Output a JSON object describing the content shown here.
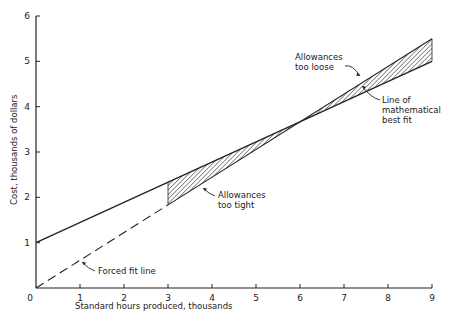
{
  "chart_data": {
    "type": "line",
    "title": "",
    "xlabel": "Standard hours produced, thousands",
    "ylabel": "Cost, thousands of dollars",
    "xlim": [
      0,
      9
    ],
    "ylim": [
      0,
      6
    ],
    "x_ticks": [
      "0",
      "1",
      "2",
      "3",
      "4",
      "5",
      "6",
      "7",
      "8",
      "9"
    ],
    "y_ticks": [
      "1",
      "2",
      "3",
      "4",
      "5",
      "6"
    ],
    "grid": false,
    "series": [
      {
        "name": "Line of mathematical best fit",
        "style": "solid",
        "points": [
          [
            0,
            1.0
          ],
          [
            9,
            5.0
          ]
        ]
      },
      {
        "name": "Forced fit line",
        "style": "dashed from 0 to 3, solid from 3 to 9",
        "points": [
          [
            0,
            0.0
          ],
          [
            9,
            5.5
          ]
        ]
      }
    ],
    "shaded_regions": [
      {
        "name": "Allowances too tight",
        "x_range": [
          3,
          6
        ],
        "between": [
          "Line of mathematical best fit",
          "Forced fit line"
        ],
        "pattern": "hatched"
      },
      {
        "name": "Allowances too loose",
        "x_range": [
          6,
          9
        ],
        "between": [
          "Forced fit line",
          "Line of mathematical best fit"
        ],
        "pattern": "hatched"
      }
    ],
    "annotations": [
      {
        "text_lines": [
          "Allowances",
          "too loose"
        ],
        "points_to": [
          7.4,
          4.5
        ]
      },
      {
        "text_lines": [
          "Line of",
          "mathematical",
          "best fit"
        ],
        "points_to": [
          7.5,
          4.35
        ]
      },
      {
        "text_lines": [
          "Allowances",
          "too tight"
        ],
        "points_to": [
          4.2,
          2.3
        ]
      },
      {
        "text_lines": [
          "Forced fit line"
        ],
        "points_to": [
          1.0,
          0.61
        ]
      }
    ]
  }
}
